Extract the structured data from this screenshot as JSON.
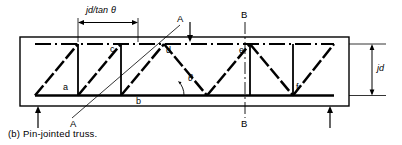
{
  "figure": {
    "caption": "(b)  Pin-jointed truss.",
    "dimensions": {
      "span_label_html": "jd/tan",
      "span_label_theta": "θ",
      "depth_label": "jd"
    },
    "angle_label": "θ",
    "nodes": [
      {
        "id": "a",
        "label": "a",
        "x": 63,
        "y": 88
      },
      {
        "id": "b",
        "label": "b",
        "x": 136,
        "y": 101
      },
      {
        "id": "c",
        "label": "c",
        "x": 118,
        "y": 49
      },
      {
        "id": "d",
        "label": "d",
        "x": 171,
        "y": 51
      },
      {
        "id": "e",
        "label": "e",
        "x": 241,
        "y": 51
      },
      {
        "id": "f",
        "label": "f",
        "x": 290,
        "y": 88
      }
    ],
    "section_marks": [
      {
        "id": "A-top",
        "label": "A",
        "x": 176,
        "y": 18
      },
      {
        "id": "A-bottom",
        "label": "A",
        "x": 74,
        "y": 124
      },
      {
        "id": "B-top",
        "label": "B",
        "x": 244,
        "y": 13
      },
      {
        "id": "B-bottom",
        "label": "B",
        "x": 244,
        "y": 123
      }
    ],
    "colors": {
      "line": "#000000",
      "background": "#ffffff",
      "thin_line": "#333333"
    }
  }
}
